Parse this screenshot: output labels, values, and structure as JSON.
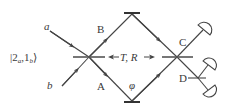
{
  "diagram": {
    "type": "Mach-Zehnder interferometer",
    "colors": {
      "line": "#444444",
      "text": "#3a3a3a",
      "background": "#ffffff"
    },
    "labels": {
      "input_a": "a",
      "input_b": "b",
      "state_ket_open": "|2",
      "state_sub_a": "a",
      "state_comma": ",1",
      "state_sub_b": "b",
      "state_ket_close": "⟩",
      "path_B": "B",
      "path_A": "A",
      "port_C": "C",
      "port_D": "D",
      "beamsplitter_params": "T, R",
      "phase": "φ"
    },
    "components": [
      {
        "name": "input-beam-splitter",
        "label": "T, R"
      },
      {
        "name": "upper-mirror"
      },
      {
        "name": "lower-mirror",
        "phase": "φ"
      },
      {
        "name": "output-beam-splitter"
      },
      {
        "name": "detector-c",
        "port": "C"
      },
      {
        "name": "detector-d1",
        "port": "D"
      },
      {
        "name": "detector-d2",
        "port": "D"
      }
    ]
  }
}
